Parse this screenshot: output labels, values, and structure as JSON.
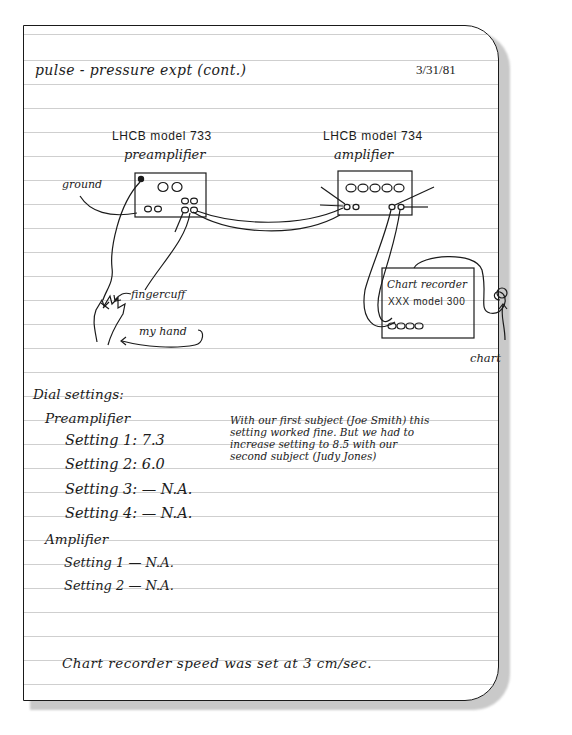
{
  "notebook": {
    "title": "pulse - pressure expt (cont.)",
    "date": "3/31/81"
  },
  "diagram": {
    "preamp": {
      "model_line": "LHCB model 733",
      "name_line": "preamplifier"
    },
    "amp": {
      "model_line": "LHCB model 734",
      "name_line": "amplifier"
    },
    "recorder": {
      "name_line": "Chart recorder",
      "model_line": "XXX model 300"
    },
    "labels": {
      "ground": "ground",
      "fingercuff": "fingercuff",
      "my_hand": "my hand",
      "chart": "chart"
    }
  },
  "settings": {
    "heading": "Dial settings:",
    "preamplifier": {
      "label": "Preamplifier",
      "items": [
        {
          "label": "Setting 1: 7.3"
        },
        {
          "label": "Setting 2: 6.0"
        },
        {
          "label": "Setting 3: — N.A."
        },
        {
          "label": "Setting 4: — N.A."
        }
      ]
    },
    "amplifier": {
      "label": "Amplifier",
      "items": [
        {
          "label": "Setting 1 — N.A."
        },
        {
          "label": "Setting 2 — N.A."
        }
      ]
    },
    "note_lines": [
      "With our first subject (Joe Smith) this",
      "setting worked fine. But we had to",
      "increase setting to 8.5 with our",
      "second subject (Judy Jones)"
    ]
  },
  "footer_note": "Chart recorder speed was set at 3 cm/sec."
}
